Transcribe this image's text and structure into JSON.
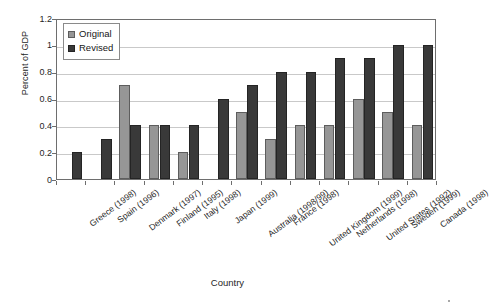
{
  "chart_data": {
    "type": "bar",
    "title": "",
    "xlabel": "Country",
    "ylabel": "Percent of GDP",
    "ylim": [
      0,
      1.2
    ],
    "ytick_values": [
      0,
      0.2,
      0.4,
      0.6,
      0.8,
      1,
      1.2
    ],
    "ytick_labels": [
      "0",
      "0.2",
      "0.4",
      "0.6",
      "0.8",
      "1",
      "1.2"
    ],
    "grid": true,
    "legend_position": "top-left-inside",
    "categories": [
      "Greece (1998)",
      "Spain (1996)",
      "Denmark (1997)",
      "Finland (1995)",
      "Italy (1998)",
      "Japan (1999)",
      "Australia (1998/99)",
      "France (1998)",
      "United Kingdom (1999)",
      "Netherlands (1998)",
      "United States (1992)",
      "Sweden (1999)",
      "Canada (1998)"
    ],
    "series": [
      {
        "name": "Original",
        "color": "#969696",
        "values": [
          null,
          null,
          0.7,
          0.4,
          0.2,
          null,
          0.5,
          0.3,
          0.4,
          0.4,
          0.6,
          0.5,
          0.4
        ]
      },
      {
        "name": "Revised",
        "color": "#393939",
        "values": [
          0.2,
          0.3,
          0.4,
          0.4,
          0.4,
          0.6,
          0.7,
          0.8,
          0.8,
          0.9,
          0.9,
          1.0,
          1.0
        ]
      }
    ]
  },
  "legend": {
    "items": [
      {
        "label": "Original",
        "key": "original"
      },
      {
        "label": "Revised",
        "key": "revised"
      }
    ]
  },
  "axes": {
    "y_title": "Percent of GDP",
    "x_title": "Country"
  }
}
